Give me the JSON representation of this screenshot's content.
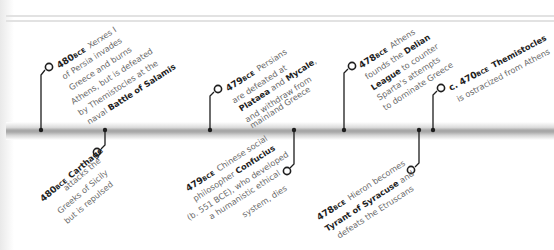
{
  "timeline": {
    "bar_color": "#a8a8a8",
    "marker_color": "#1e1e1e",
    "events": [
      {
        "id": "xerxes",
        "year": "480",
        "era": "BCE",
        "position": "above",
        "lines": [
          {
            "pre": "",
            "bold": "",
            "post": "Xerxes I"
          },
          {
            "pre": "of Persia invades",
            "bold": "",
            "post": ""
          },
          {
            "pre": "Greece and burns",
            "bold": "",
            "post": ""
          },
          {
            "pre": "Athens, but is defeated",
            "bold": "",
            "post": ""
          },
          {
            "pre": "by Themistocles at the",
            "bold": "",
            "post": ""
          },
          {
            "pre": "naval ",
            "bold": "Battle of Salamis",
            "post": ""
          }
        ]
      },
      {
        "id": "carthage",
        "year": "480",
        "era": "BCE",
        "position": "below",
        "lines": [
          {
            "pre": "",
            "bold": "Carthage",
            "post": ""
          },
          {
            "pre": "attacks the",
            "bold": "",
            "post": ""
          },
          {
            "pre": "Greeks of Sicily",
            "bold": "",
            "post": ""
          },
          {
            "pre": "but is repulsed",
            "bold": "",
            "post": ""
          }
        ]
      },
      {
        "id": "persians",
        "year": "479",
        "era": "BCE",
        "position": "above",
        "lines": [
          {
            "pre": "",
            "bold": "",
            "post": "Persians"
          },
          {
            "pre": "are defeated at",
            "bold": "",
            "post": ""
          },
          {
            "pre": "",
            "bold": "Plataea",
            "post": " and "
          },
          {
            "pre": "and withdraw from",
            "bold": "",
            "post": ""
          },
          {
            "pre": "mainland Greece",
            "bold": "",
            "post": ""
          }
        ],
        "mycale": "Mycale",
        "mycale_suffix": ","
      },
      {
        "id": "confucius",
        "year": "479",
        "era": "BCE",
        "position": "below",
        "lines": [
          {
            "pre": "",
            "bold": "",
            "post": "Chinese social"
          },
          {
            "pre": "philosopher ",
            "bold": "Confucius",
            "post": ""
          },
          {
            "pre": "(b. 551 BCE), who developed",
            "bold": "",
            "post": ""
          },
          {
            "pre": "a humanistic ethical",
            "bold": "",
            "post": ""
          },
          {
            "pre": "system, dies",
            "bold": "",
            "post": ""
          }
        ]
      },
      {
        "id": "delian",
        "year": "478",
        "era": "BCE",
        "position": "above",
        "lines": [
          {
            "pre": "",
            "bold": "",
            "post": "Athens"
          },
          {
            "pre": "founds the ",
            "bold": "Delian",
            "post": ""
          },
          {
            "pre": "",
            "bold": "League",
            "post": " to counter"
          },
          {
            "pre": "Sparta's attempts",
            "bold": "",
            "post": ""
          },
          {
            "pre": "to dominate Greece",
            "bold": "",
            "post": ""
          }
        ]
      },
      {
        "id": "hieron",
        "year": "478",
        "era": "BCE",
        "position": "below",
        "lines": [
          {
            "pre": "",
            "bold": "",
            "post": "Hieron becomes"
          },
          {
            "pre": "",
            "bold": "Tyrant of Syracuse",
            "post": " and"
          },
          {
            "pre": "defeats the Etruscans",
            "bold": "",
            "post": ""
          }
        ]
      },
      {
        "id": "themistocles",
        "year": "c. 470",
        "era": "BCE",
        "position": "above",
        "lines": [
          {
            "pre": "",
            "bold": "Themistocles",
            "post": ""
          },
          {
            "pre": "is ostracized from Athens",
            "bold": "",
            "post": ""
          }
        ]
      }
    ]
  }
}
